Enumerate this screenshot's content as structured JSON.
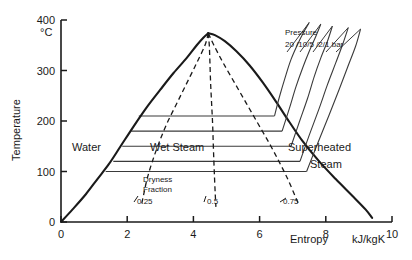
{
  "chart_data": {
    "type": "line",
    "title": "",
    "xlabel": "Entropy",
    "x_unit": "kJ/kgK",
    "ylabel": "Temperature",
    "y_unit": "°C",
    "xlim": [
      0,
      10
    ],
    "ylim": [
      0,
      400
    ],
    "grid": false,
    "legend": "none",
    "x_ticks": [
      "0",
      "2",
      "4",
      "6",
      "8",
      "10"
    ],
    "x_tick_values": [
      0,
      2,
      4,
      6,
      8,
      10
    ],
    "y_ticks": [
      "0",
      "100",
      "200",
      "300",
      "400"
    ],
    "y_tick_values": [
      0,
      100,
      200,
      300,
      400
    ],
    "critical_point": {
      "s": 4.45,
      "T": 374
    },
    "series": [
      {
        "name": "saturated-liquid-line",
        "style": "solid",
        "points": [
          [
            0,
            0
          ],
          [
            0.35,
            25
          ],
          [
            0.75,
            55
          ],
          [
            1.1,
            85
          ],
          [
            1.45,
            115
          ],
          [
            1.8,
            150
          ],
          [
            2.2,
            190
          ],
          [
            2.6,
            228
          ],
          [
            3.0,
            262
          ],
          [
            3.4,
            295
          ],
          [
            3.8,
            325
          ],
          [
            4.1,
            350
          ],
          [
            4.3,
            365
          ],
          [
            4.45,
            374
          ]
        ]
      },
      {
        "name": "saturated-vapour-line",
        "style": "solid",
        "points": [
          [
            4.45,
            374
          ],
          [
            4.65,
            370
          ],
          [
            4.95,
            358
          ],
          [
            5.3,
            338
          ],
          [
            5.7,
            310
          ],
          [
            6.1,
            276
          ],
          [
            6.5,
            238
          ],
          [
            6.9,
            198
          ],
          [
            7.3,
            160
          ],
          [
            7.8,
            120
          ],
          [
            8.3,
            85
          ],
          [
            8.8,
            52
          ],
          [
            9.2,
            25
          ],
          [
            9.4,
            8
          ]
        ]
      },
      {
        "name": "dryness-fraction-0.25",
        "style": "dashed",
        "value": 0.25,
        "points": [
          [
            4.45,
            374
          ],
          [
            4.35,
            350
          ],
          [
            4.1,
            315
          ],
          [
            3.8,
            275
          ],
          [
            3.5,
            235
          ],
          [
            3.2,
            195
          ],
          [
            2.95,
            155
          ],
          [
            2.75,
            118
          ],
          [
            2.6,
            85
          ],
          [
            2.5,
            55
          ],
          [
            2.42,
            30
          ]
        ]
      },
      {
        "name": "dryness-fraction-0.5",
        "style": "dashed",
        "value": 0.5,
        "points": [
          [
            4.45,
            374
          ],
          [
            4.48,
            350
          ],
          [
            4.5,
            315
          ],
          [
            4.52,
            275
          ],
          [
            4.55,
            235
          ],
          [
            4.58,
            195
          ],
          [
            4.6,
            155
          ],
          [
            4.62,
            118
          ],
          [
            4.64,
            85
          ],
          [
            4.66,
            55
          ],
          [
            4.68,
            30
          ]
        ]
      },
      {
        "name": "dryness-fraction-0.75",
        "style": "dashed",
        "value": 0.75,
        "points": [
          [
            4.45,
            374
          ],
          [
            4.62,
            350
          ],
          [
            4.9,
            315
          ],
          [
            5.25,
            275
          ],
          [
            5.6,
            235
          ],
          [
            5.95,
            195
          ],
          [
            6.3,
            155
          ],
          [
            6.6,
            118
          ],
          [
            6.85,
            85
          ],
          [
            7.05,
            55
          ],
          [
            7.2,
            32
          ]
        ]
      }
    ],
    "saturation_isobar_lines": [
      {
        "name": "isobar-210C",
        "T": 210,
        "s_start": 2.35,
        "s_end": 6.45
      },
      {
        "name": "isobar-180C",
        "T": 180,
        "s_start": 2.12,
        "s_end": 6.68
      },
      {
        "name": "isobar-150C",
        "T": 150,
        "s_start": 1.85,
        "s_end": 6.95
      },
      {
        "name": "isobar-120C",
        "T": 120,
        "s_start": 1.58,
        "s_end": 7.22
      },
      {
        "name": "isobar-100C",
        "T": 100,
        "s_start": 1.35,
        "s_end": 7.42
      }
    ],
    "superheat_isobars": [
      {
        "label": "20",
        "points": [
          [
            6.45,
            210
          ],
          [
            6.6,
            248
          ],
          [
            6.78,
            288
          ],
          [
            6.95,
            322
          ],
          [
            7.15,
            352
          ],
          [
            7.35,
            378
          ],
          [
            7.5,
            395
          ]
        ]
      },
      {
        "label": "10",
        "points": [
          [
            6.68,
            180
          ],
          [
            6.9,
            225
          ],
          [
            7.1,
            268
          ],
          [
            7.3,
            305
          ],
          [
            7.5,
            338
          ],
          [
            7.7,
            368
          ],
          [
            7.85,
            392
          ]
        ]
      },
      {
        "label": "5",
        "points": [
          [
            6.95,
            150
          ],
          [
            7.2,
            198
          ],
          [
            7.45,
            245
          ],
          [
            7.65,
            288
          ],
          [
            7.85,
            325
          ],
          [
            8.05,
            358
          ],
          [
            8.2,
            388
          ]
        ]
      },
      {
        "label": "2",
        "points": [
          [
            7.22,
            120
          ],
          [
            7.5,
            172
          ],
          [
            7.8,
            225
          ],
          [
            8.05,
            272
          ],
          [
            8.3,
            315
          ],
          [
            8.5,
            350
          ],
          [
            8.68,
            385
          ]
        ]
      },
      {
        "label": "1",
        "points": [
          [
            7.42,
            100
          ],
          [
            7.75,
            155
          ],
          [
            8.1,
            212
          ],
          [
            8.4,
            262
          ],
          [
            8.65,
            305
          ],
          [
            8.9,
            348
          ],
          [
            9.05,
            382
          ]
        ]
      }
    ],
    "annotations": {
      "water": "Water",
      "wet_steam": "Wet  Steam",
      "superheated_line1": "Superheated",
      "superheated_line2": "Steam",
      "pressure_title": "Pressure",
      "pressure_values": "20 /10/5 /2/1 bar",
      "dryness_line1": "Dryness",
      "dryness_line2": "Fraction",
      "dryness_025": "0.25",
      "dryness_05": "0.5",
      "dryness_075": "0.75"
    },
    "colors": {
      "line": "#1a1a1a",
      "axis": "#1a1a1a",
      "isobar": "#3a3a3a",
      "background": "#ffffff"
    }
  }
}
